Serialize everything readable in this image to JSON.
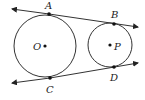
{
  "diagram": {
    "type": "two circles with common external tangents",
    "circles": [
      {
        "center_label": "O",
        "cx": 45,
        "cy": 46,
        "r": 31
      },
      {
        "center_label": "P",
        "cx": 110,
        "cy": 45,
        "r": 22
      }
    ],
    "points": [
      {
        "label": "A",
        "x": 49,
        "y": 14
      },
      {
        "label": "B",
        "x": 114,
        "y": 24
      },
      {
        "label": "C",
        "x": 50,
        "y": 78
      },
      {
        "label": "D",
        "x": 114,
        "y": 67
      }
    ],
    "tangent_lines": [
      {
        "name": "AB",
        "x1": 11,
        "y1": 9,
        "x2": 138,
        "y2": 27
      },
      {
        "name": "CD",
        "x1": 11,
        "y1": 83,
        "x2": 138,
        "y2": 63
      }
    ],
    "labels": {
      "A": "A",
      "B": "B",
      "C": "C",
      "D": "D",
      "O": "O",
      "P": "P"
    }
  }
}
